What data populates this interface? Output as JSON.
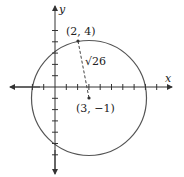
{
  "diagram": {
    "type": "circle-on-coordinate-plane",
    "axes": {
      "x_label": "x",
      "y_label": "y"
    },
    "circle": {
      "center_label": "(3, −1)",
      "point_label": "(2, 4)",
      "radius_label": "√26",
      "radius_sqrt_text": "26"
    },
    "colors": {
      "stroke": "#555555",
      "axis": "#333333",
      "text": "#222222"
    }
  }
}
